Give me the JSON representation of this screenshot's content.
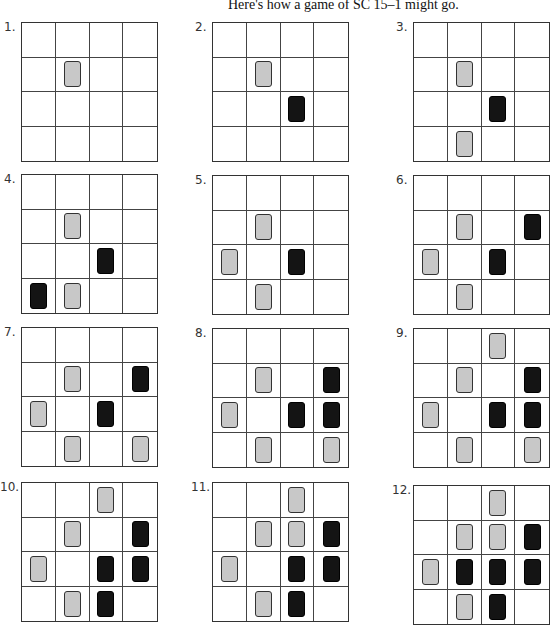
{
  "title": "Here's how a game of SC 15–1 might go.",
  "piece_colors": {
    "gray": "#c8c8c8",
    "black": "#141414"
  },
  "diagrams": [
    {
      "label": "1.",
      "x": 21,
      "y": 22,
      "gray": [
        [
          1,
          1
        ]
      ],
      "black": []
    },
    {
      "label": "2.",
      "x": 212,
      "y": 22,
      "gray": [
        [
          1,
          1
        ]
      ],
      "black": [
        [
          2,
          2
        ]
      ]
    },
    {
      "label": "3.",
      "x": 413,
      "y": 22,
      "gray": [
        [
          1,
          1
        ],
        [
          3,
          1
        ]
      ],
      "black": [
        [
          2,
          2
        ]
      ]
    },
    {
      "label": "4.",
      "x": 21,
      "y": 174,
      "gray": [
        [
          1,
          1
        ],
        [
          3,
          1
        ]
      ],
      "black": [
        [
          2,
          2
        ],
        [
          3,
          0
        ]
      ]
    },
    {
      "label": "5.",
      "x": 212,
      "y": 175,
      "gray": [
        [
          1,
          1
        ],
        [
          3,
          1
        ],
        [
          2,
          0
        ]
      ],
      "black": [
        [
          2,
          2
        ]
      ]
    },
    {
      "label": "6.",
      "x": 413,
      "y": 175,
      "gray": [
        [
          1,
          1
        ],
        [
          3,
          1
        ],
        [
          2,
          0
        ]
      ],
      "black": [
        [
          2,
          2
        ],
        [
          1,
          3
        ]
      ]
    },
    {
      "label": "7.",
      "x": 21,
      "y": 327,
      "gray": [
        [
          1,
          1
        ],
        [
          3,
          1
        ],
        [
          2,
          0
        ],
        [
          3,
          3
        ]
      ],
      "black": [
        [
          2,
          2
        ],
        [
          1,
          3
        ]
      ]
    },
    {
      "label": "8.",
      "x": 212,
      "y": 328,
      "gray": [
        [
          1,
          1
        ],
        [
          3,
          1
        ],
        [
          2,
          0
        ],
        [
          3,
          3
        ]
      ],
      "black": [
        [
          2,
          2
        ],
        [
          1,
          3
        ],
        [
          2,
          3
        ]
      ]
    },
    {
      "label": "9.",
      "x": 413,
      "y": 328,
      "gray": [
        [
          1,
          1
        ],
        [
          3,
          1
        ],
        [
          2,
          0
        ],
        [
          3,
          3
        ],
        [
          0,
          2
        ]
      ],
      "black": [
        [
          2,
          2
        ],
        [
          1,
          3
        ],
        [
          2,
          3
        ]
      ]
    },
    {
      "label": "10.",
      "x": 21,
      "y": 482,
      "gray": [
        [
          1,
          1
        ],
        [
          3,
          1
        ],
        [
          2,
          0
        ],
        [
          0,
          2
        ]
      ],
      "black": [
        [
          2,
          2
        ],
        [
          1,
          3
        ],
        [
          2,
          3
        ],
        [
          3,
          2
        ]
      ]
    },
    {
      "label": "11.",
      "x": 212,
      "y": 482,
      "gray": [
        [
          1,
          1
        ],
        [
          3,
          1
        ],
        [
          2,
          0
        ],
        [
          0,
          2
        ],
        [
          1,
          2
        ]
      ],
      "black": [
        [
          2,
          2
        ],
        [
          1,
          3
        ],
        [
          2,
          3
        ],
        [
          3,
          2
        ]
      ]
    },
    {
      "label": "12.",
      "x": 413,
      "y": 485,
      "gray": [
        [
          1,
          1
        ],
        [
          3,
          1
        ],
        [
          2,
          0
        ],
        [
          0,
          2
        ],
        [
          1,
          2
        ]
      ],
      "black": [
        [
          2,
          2
        ],
        [
          1,
          3
        ],
        [
          2,
          3
        ],
        [
          3,
          2
        ],
        [
          2,
          1
        ]
      ]
    }
  ]
}
